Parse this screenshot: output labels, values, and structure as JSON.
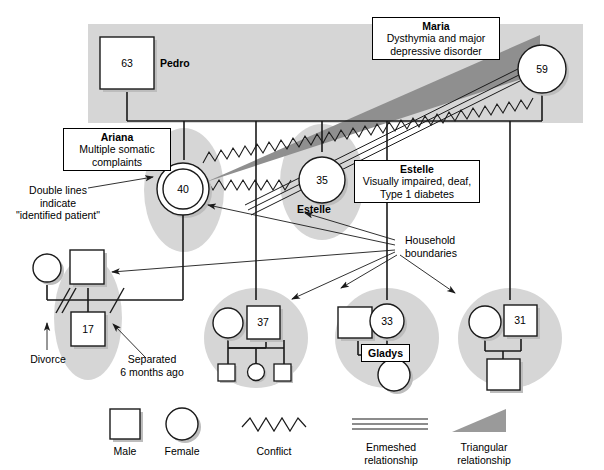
{
  "figure": {
    "type": "genogram"
  },
  "persons": {
    "pedro": {
      "name": "Pedro",
      "age": "63",
      "gender": "male"
    },
    "maria": {
      "name": "Maria",
      "age": "59",
      "gender": "female",
      "note_title": "Maria",
      "note_text": "Dysthymia and major depressive disorder"
    },
    "ariana": {
      "name": "Ariana",
      "age": "40",
      "gender": "female",
      "identified_patient": true,
      "note_title": "Ariana",
      "note_text": "Multiple somatic complaints"
    },
    "estelle": {
      "name": "Estelle",
      "age": "35",
      "gender": "female",
      "note_title": "Estelle",
      "note_text": "Visually impaired, deaf, Type 1 diabetes"
    },
    "child_17": {
      "age": "17",
      "gender": "male"
    },
    "child_37": {
      "age": "37",
      "gender": "male"
    },
    "child_33": {
      "age": "33",
      "gender": "female"
    },
    "child_31": {
      "age": "31",
      "gender": "male"
    },
    "gladys": {
      "name": "Gladys",
      "gender": "female"
    }
  },
  "annotations": {
    "identified_patient": "Double lines\nindicate\n\"identified patient\"",
    "identified_patient_line1": "Double lines",
    "identified_patient_line2": "indicate",
    "identified_patient_line3": "\"identified patient\"",
    "household_boundaries_line1": "Household",
    "household_boundaries_line2": "boundaries",
    "divorce": "Divorce",
    "separated_line1": "Separated",
    "separated_line2": "6 months ago"
  },
  "legend": {
    "items": [
      {
        "key": "male",
        "label": "Male",
        "shape": "square"
      },
      {
        "key": "female",
        "label": "Female",
        "shape": "circle"
      },
      {
        "key": "conflict",
        "label": "Conflict",
        "shape": "zigzag"
      },
      {
        "key": "enmeshed",
        "label_line1": "Enmeshed",
        "label_line2": "relationship",
        "shape": "triple-line"
      },
      {
        "key": "triangular",
        "label_line1": "Triangular",
        "label_line2": "relationship",
        "shape": "wedge"
      }
    ]
  },
  "colors": {
    "household_fill": "#d6d6d6",
    "triangle_fill": "#8f8f8f",
    "legend_wedge_fill": "#9a9a9a",
    "stroke": "#1a1a1a",
    "symbol_fill": "#ffffff",
    "shadow": "#bdbdbd",
    "background": "#ffffff"
  }
}
